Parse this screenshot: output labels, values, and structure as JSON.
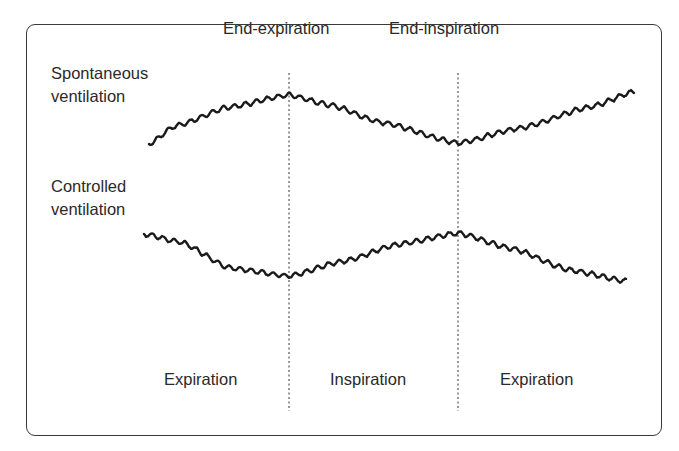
{
  "diagram": {
    "row_labels": {
      "spontaneous": [
        "Spontaneous",
        "ventilation"
      ],
      "controlled": [
        "Controlled",
        "ventilation"
      ]
    },
    "markers": {
      "end_expiration": "End-expiration",
      "end_inspiration": "End-inspiration"
    },
    "phases": [
      "Expiration",
      "Inspiration",
      "Expiration"
    ],
    "colors": {
      "trace": "#1a1a1a",
      "divider": "#555555",
      "frame": "#3a3a3a",
      "text": "#2a2a2a"
    }
  }
}
